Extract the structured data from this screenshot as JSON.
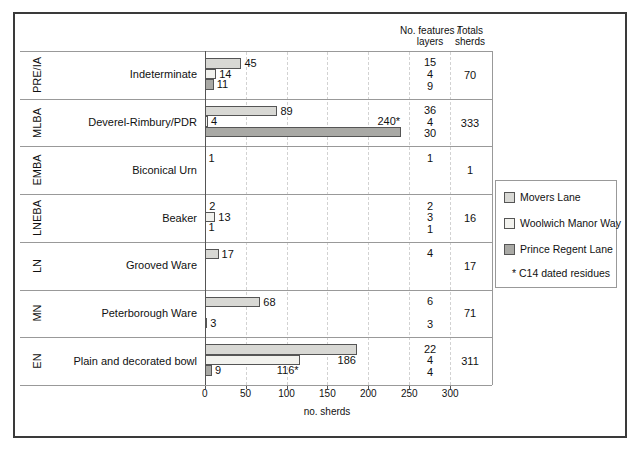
{
  "figure": {
    "columns": {
      "features_header_line1": "No. features /",
      "features_header_line2": "layers",
      "totals_header_line1": "Totals",
      "totals_header_line2": "sherds"
    },
    "legend": {
      "items": [
        {
          "name": "Movers Lane",
          "color": "#d8d8d4"
        },
        {
          "name": "Woolwich Manor Way",
          "color": "#f2f2ee"
        },
        {
          "name": "Prince Regent Lane",
          "color": "#a9a9a5"
        }
      ],
      "footnote": "* C14 dated residues"
    }
  },
  "chart_data": {
    "type": "bar",
    "orientation": "horizontal",
    "title": "",
    "xlabel": "no. sherds",
    "xlim": [
      0,
      300
    ],
    "x_ticks": [
      0,
      50,
      100,
      150,
      200,
      250,
      300
    ],
    "grid": "vertical dashed at ticks",
    "legend_position": "right",
    "series": [
      "Movers Lane",
      "Woolwich Manor Way",
      "Prince Regent Lane"
    ],
    "rows": [
      {
        "period": "PRE/IA",
        "category": "Indeterminate",
        "values": [
          45,
          14,
          11
        ],
        "bar_labels": [
          "45",
          "14",
          "11"
        ],
        "features": [
          "15",
          "4",
          "9"
        ],
        "total": "70",
        "placements": {}
      },
      {
        "period": "MLBA",
        "category": "Deverel-Rimbury/PDR",
        "values": [
          89,
          4,
          240
        ],
        "bar_labels": [
          "89",
          "4",
          "240*"
        ],
        "features": [
          "36",
          "4",
          "30"
        ],
        "total": "333",
        "placements": {
          "2": "above-end"
        }
      },
      {
        "period": "EMBA",
        "category": "Biconical Urn",
        "values": [
          1,
          null,
          null
        ],
        "bar_labels": [
          "1",
          "",
          ""
        ],
        "features": [
          "1",
          "",
          ""
        ],
        "total": "1",
        "placements": {}
      },
      {
        "period": "LNEBA",
        "category": "Beaker",
        "values": [
          2,
          13,
          1
        ],
        "bar_labels": [
          "2",
          "13",
          "1"
        ],
        "features": [
          "2",
          "3",
          "1"
        ],
        "total": "16",
        "placements": {}
      },
      {
        "period": "LN",
        "category": "Grooved Ware",
        "values": [
          17,
          null,
          null
        ],
        "bar_labels": [
          "17",
          "",
          ""
        ],
        "features": [
          "4",
          "",
          ""
        ],
        "total": "17",
        "placements": {}
      },
      {
        "period": "MN",
        "category": "Peterborough Ware",
        "values": [
          68,
          null,
          3
        ],
        "bar_labels": [
          "68",
          "",
          "3"
        ],
        "features": [
          "6",
          "",
          "3"
        ],
        "total": "71",
        "placements": {}
      },
      {
        "period": "EN",
        "category": "Plain and decorated bowl",
        "values": [
          186,
          116,
          9
        ],
        "bar_labels": [
          "186",
          "116*",
          "9"
        ],
        "features": [
          "22",
          "4",
          "4"
        ],
        "total": "311",
        "placements": {
          "0": "below-end",
          "1": "below-end"
        }
      }
    ]
  }
}
